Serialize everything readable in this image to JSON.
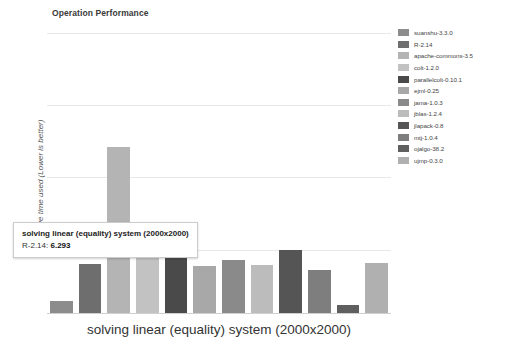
{
  "chart_data": {
    "type": "bar",
    "title": "Operation Performance",
    "xlabel": "solving linear (equality) system (2000x2000)",
    "ylabel": "Relative time used (Lower is better)",
    "grid": true,
    "legend_position": "right",
    "ylim": [
      0,
      40
    ],
    "categories": [
      "suanshu-3.3.0",
      "R-2.14",
      "apache-commons-3.5",
      "colt-1.2.0",
      "parallelcolt-0.10.1",
      "ejml-0.25",
      "jama-1.0.3",
      "jblas-1.2.4",
      "jlapack-0.8",
      "mtj-1.0.4",
      "ojalgo-38.2",
      "ujmp-0.3.0"
    ],
    "values": [
      1.5,
      6.293,
      29.0,
      8.2,
      8.2,
      6.3,
      7.1,
      6.4,
      9.0,
      5.8,
      0.9,
      6.6
    ],
    "colors": [
      "#8c8c8c",
      "#6e6e6e",
      "#b4b4b4",
      "#c2c2c2",
      "#4a4a4a",
      "#a8a8a8",
      "#8a8a8a",
      "#bcbcbc",
      "#555555",
      "#7e7e7e",
      "#5f5f5f",
      "#b0b0b0"
    ],
    "gridline_values": [
      40,
      30,
      20,
      10
    ],
    "bar_pixel_heights": [
      12,
      49,
      166,
      60,
      60,
      47,
      53,
      48,
      63,
      43,
      8,
      50
    ]
  },
  "tooltip": {
    "title": "solving linear (equality) system (2000x2000)",
    "series": "R-2.14:",
    "value": "6.293"
  }
}
